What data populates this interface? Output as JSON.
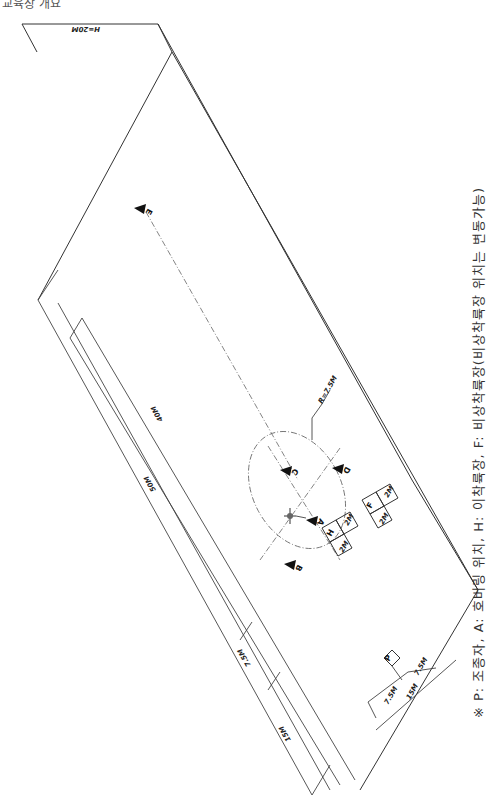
{
  "header": {
    "text": "교육장 개요"
  },
  "note": {
    "text": "※ P: 조종자, A: 호버링 위치, H: 이착륙장, F: 비상착륙장(비상착륙장 위치는 변동가능)"
  },
  "dimensions": {
    "height": "H=20M",
    "length_total": "50M",
    "length_inner": "40M",
    "offset_7_5": "7.5M",
    "offset_15": "15M",
    "radius": "R=7.5M",
    "pilot_left": "7.5M",
    "pilot_right": "7.5M",
    "pilot_total": "15M",
    "pad_size_h": "2M",
    "pad_size_f": "2M"
  },
  "points": {
    "A": "A",
    "B": "B",
    "C": "C",
    "D": "D",
    "E": "E",
    "P": "P",
    "H": "H",
    "F": "F",
    "H_size": "2M",
    "F_size": "2M",
    "H_side": "2M",
    "F_side": "2M"
  }
}
